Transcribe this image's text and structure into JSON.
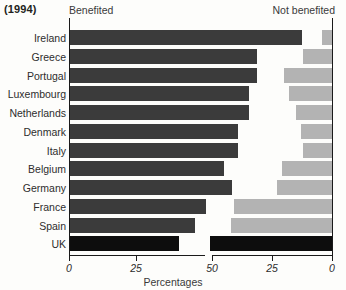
{
  "year_caption": "(1994)",
  "headers": {
    "left": "Benefited",
    "right": "Not benefited"
  },
  "x_axis_title": "Percentages",
  "colors": {
    "benefited_bar": "#3b3b3b",
    "not_benefited_bar": "#b3b3b3",
    "uk_bar": "#0d0d0d",
    "axis": "#1a1a1a",
    "background": "#fdfdfb",
    "text": "#2d2d2d"
  },
  "axis": {
    "left_ticks": [
      "0",
      "25"
    ],
    "left_tick_values": [
      0,
      25
    ],
    "right_ticks": [
      "50",
      "25",
      "0"
    ],
    "right_tick_values": [
      50,
      25,
      0
    ],
    "left_range": [
      0,
      50
    ],
    "right_range": [
      50,
      0
    ],
    "right_reversed": true,
    "grid": false
  },
  "chart_data": {
    "type": "bar",
    "title": "(1994)",
    "subtitle": "",
    "xlabel": "Percentages",
    "ylabel": "",
    "orientation": "horizontal",
    "layout": "diverging-paired",
    "legend_position": "top",
    "grid": false,
    "categories": [
      "Ireland",
      "Greece",
      "Portugal",
      "Luxembourg",
      "Netherlands",
      "Denmark",
      "Italy",
      "Belgium",
      "Germany",
      "France",
      "Spain",
      "UK"
    ],
    "series": [
      {
        "name": "Benefited",
        "axis": "left",
        "values": [
          87,
          70,
          70,
          67,
          67,
          63,
          63,
          58,
          61,
          51,
          47,
          41
        ]
      },
      {
        "name": "Not benefited",
        "axis": "right",
        "values": [
          4,
          12,
          20,
          18,
          15,
          13,
          12,
          21,
          23,
          41,
          42,
          51
        ]
      }
    ],
    "xlim_left": [
      0,
      50
    ],
    "xlim_right": [
      50,
      0
    ],
    "note": "Left panel x-axis runs 0 to 50 rightward; right panel x-axis runs 50 to 0 rightward (reversed). UK row is rendered in black, other rows dark grey (left) and light grey (right)."
  },
  "rows": [
    {
      "label": "Ireland",
      "benefited": 87,
      "not_benefited": 4,
      "style": "normal"
    },
    {
      "label": "Greece",
      "benefited": 70,
      "not_benefited": 12,
      "style": "normal"
    },
    {
      "label": "Portugal",
      "benefited": 70,
      "not_benefited": 20,
      "style": "normal"
    },
    {
      "label": "Luxembourg",
      "benefited": 67,
      "not_benefited": 18,
      "style": "normal"
    },
    {
      "label": "Netherlands",
      "benefited": 67,
      "not_benefited": 15,
      "style": "normal"
    },
    {
      "label": "Denmark",
      "benefited": 63,
      "not_benefited": 13,
      "style": "normal"
    },
    {
      "label": "Italy",
      "benefited": 63,
      "not_benefited": 12,
      "style": "normal"
    },
    {
      "label": "Belgium",
      "benefited": 58,
      "not_benefited": 21,
      "style": "normal"
    },
    {
      "label": "Germany",
      "benefited": 61,
      "not_benefited": 23,
      "style": "normal"
    },
    {
      "label": "France",
      "benefited": 51,
      "not_benefited": 41,
      "style": "normal"
    },
    {
      "label": "Spain",
      "benefited": 47,
      "not_benefited": 42,
      "style": "normal"
    },
    {
      "label": "UK",
      "benefited": 41,
      "not_benefited": 51,
      "style": "highlight"
    }
  ]
}
